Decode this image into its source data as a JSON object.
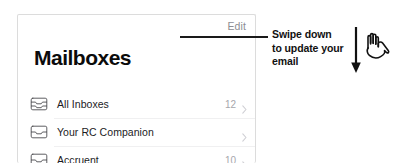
{
  "mail_app": {
    "nav": {
      "edit_label": "Edit"
    },
    "title": "Mailboxes",
    "rows": [
      {
        "icon": "inbox-stack-icon",
        "label": "All Inboxes",
        "count": "12",
        "chevron": "chevron-right-icon"
      },
      {
        "icon": "inbox-tray-icon",
        "label": "Your RC Companion",
        "count": "",
        "chevron": "chevron-right-icon"
      },
      {
        "icon": "inbox-tray-icon",
        "label": "Accruent",
        "count": "10",
        "chevron": "chevron-right-icon"
      }
    ]
  },
  "annotation": {
    "text": "Swipe down to update your email",
    "leader_line": "callout-leader-line",
    "arrow_icon": "down-arrow-icon",
    "hand_icon": "pointing-hand-icon"
  },
  "colors": {
    "text_primary": "#1b1b1e",
    "text_muted": "#8d8d92",
    "count": "#a6a6ac",
    "chevron": "#cfcfd4",
    "annotation": "#111111",
    "card_border": "#dcdcdc",
    "background": "#ffffff"
  }
}
